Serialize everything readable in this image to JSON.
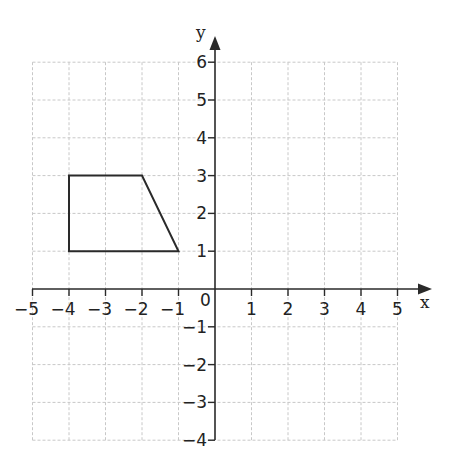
{
  "diagram": {
    "type": "coordinate-grid",
    "axes": {
      "x_label": "x",
      "y_label": "y",
      "origin_label": "0",
      "x_range": [
        -5,
        5
      ],
      "y_range": [
        -4,
        6
      ],
      "x_ticks": [
        "−5",
        "−4",
        "−3",
        "−2",
        "−1",
        "1",
        "2",
        "3",
        "4",
        "5"
      ],
      "y_ticks": [
        "6",
        "5",
        "4",
        "3",
        "2",
        "1",
        "−1",
        "−2",
        "−3",
        "−4"
      ]
    },
    "shape": {
      "name": "trapezium",
      "vertices": [
        [
          -4,
          1
        ],
        [
          -4,
          3
        ],
        [
          -2,
          3
        ],
        [
          -1,
          1
        ]
      ]
    },
    "colors": {
      "grid": "#c8c8c8",
      "axis": "#2a2a2a",
      "shape": "#2a2a2a"
    }
  }
}
